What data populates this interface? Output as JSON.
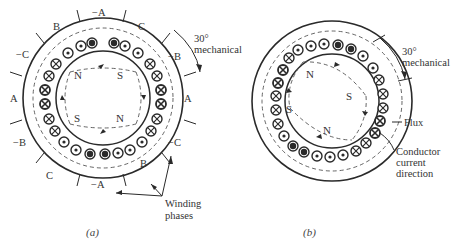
{
  "figure_a": {
    "caption": "(a)",
    "angle_label_1": "30°",
    "angle_label_2": "mechanical",
    "phase_labels": [
      "−A",
      "C",
      "−B",
      "A",
      "−C",
      "B",
      "−A",
      "C",
      "−B",
      "A",
      "−C",
      "B"
    ],
    "poles": [
      "N",
      "S",
      "S",
      "N"
    ],
    "winding_label_1": "Winding",
    "winding_label_2": "phases"
  },
  "figure_b": {
    "caption": "(b)",
    "angle_label_1": "30°",
    "angle_label_2": "mechanical",
    "poles": [
      "N",
      "S",
      "S",
      "N"
    ],
    "flux_label": "Flux",
    "conductor_label_1": "Conductor",
    "conductor_label_2": "current",
    "conductor_label_3": "direction"
  },
  "colors": {
    "line": "#2a2a2a",
    "dashed": "#555555",
    "background": "#ffffff"
  }
}
